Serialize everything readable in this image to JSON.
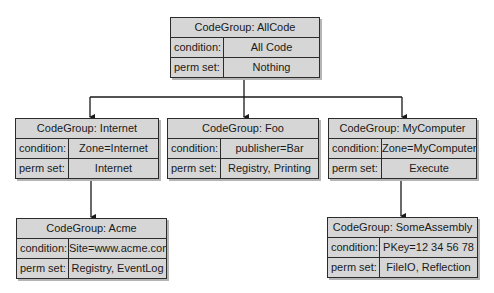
{
  "diagram": {
    "nodes": [
      {
        "id": "allcode",
        "title": "CodeGroup: AllCode",
        "condition_label": "condition:",
        "condition": "All Code",
        "permset_label": "perm set:",
        "permset": "Nothing"
      },
      {
        "id": "internet",
        "title": "CodeGroup: Internet",
        "condition_label": "condition:",
        "condition": "Zone=Internet",
        "permset_label": "perm set:",
        "permset": "Internet"
      },
      {
        "id": "foo",
        "title": "CodeGroup: Foo",
        "condition_label": "condition:",
        "condition": "publisher=Bar",
        "permset_label": "perm set:",
        "permset": "Registry, Printing"
      },
      {
        "id": "mycomputer",
        "title": "CodeGroup: MyComputer",
        "condition_label": "condition:",
        "condition": "Zone=MyComputer",
        "permset_label": "perm set:",
        "permset": "Execute"
      },
      {
        "id": "acme",
        "title": "CodeGroup: Acme",
        "condition_label": "condition:",
        "condition": "Site=www.acme.com",
        "permset_label": "perm set:",
        "permset": "Registry, EventLog"
      },
      {
        "id": "someassembly",
        "title": "CodeGroup: SomeAssembly",
        "condition_label": "condition:",
        "condition": "PKey=12 34 56 78",
        "permset_label": "perm set:",
        "permset": "FileIO, Reflection"
      }
    ],
    "edges": [
      {
        "from": "allcode",
        "to": "internet"
      },
      {
        "from": "allcode",
        "to": "foo"
      },
      {
        "from": "allcode",
        "to": "mycomputer"
      },
      {
        "from": "internet",
        "to": "acme"
      },
      {
        "from": "mycomputer",
        "to": "someassembly"
      }
    ],
    "colors": {
      "box_fill": "#d6d6d6",
      "border": "#2b2b2b",
      "shadow": "#b5b5b5"
    }
  }
}
